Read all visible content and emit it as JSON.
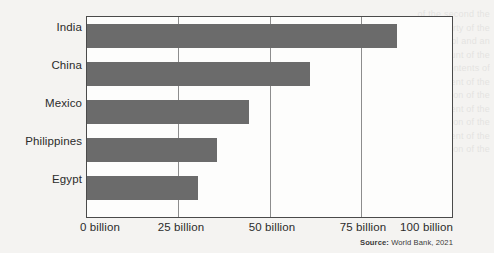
{
  "chart_data": {
    "type": "bar",
    "orientation": "horizontal",
    "title": "",
    "xlabel": "",
    "ylabel": "",
    "categories": [
      "India",
      "China",
      "Mexico",
      "Philippines",
      "Egypt"
    ],
    "values": [
      85,
      61,
      44.5,
      35.5,
      30.5
    ],
    "xlim": [
      0,
      100
    ],
    "ticks": [
      0,
      25,
      50,
      75,
      100
    ],
    "tick_labels": [
      "0 billion",
      "25 billion",
      "50 billion",
      "75 billion",
      "100 billion"
    ],
    "unit": "billion",
    "grid": true,
    "gridlines_at": [
      25,
      50,
      75
    ],
    "legend": "none",
    "bar_color": "#6b6b6b",
    "frame_color": "#4a4a4a",
    "background_color": "#f4f3f1"
  },
  "source": {
    "label": "Source:",
    "text": " World Bank, 2021"
  },
  "bleed_text": "of the second the property of the control and an account of the personal contents of the content of the section of the content of the section of the content of the section of the content of the section of the content of the section of the content of the section"
}
